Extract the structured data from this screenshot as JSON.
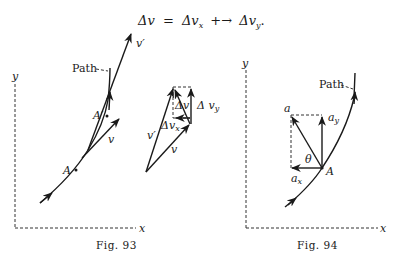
{
  "equation": {
    "lhs": "Δv",
    "eq": "=",
    "term1": "Δv",
    "term1_sub": "x",
    "op": "+→",
    "term2": "Δv",
    "term2_sub": "y",
    "end": "."
  },
  "fig93": {
    "caption": "Fig. 93",
    "axis_x": "x",
    "axis_y": "y",
    "path_label": "Path",
    "point_a": "A",
    "point_a_prime": "A′",
    "vec_v": "v",
    "vec_v_prime": "v′"
  },
  "vector_diagram": {
    "vec_v": "v",
    "vec_v_prime": "v′",
    "delta_v": "Δv",
    "delta_vx": "Δv",
    "delta_vx_sub": "x",
    "delta_vy": "Δ v",
    "delta_vy_sub": "y"
  },
  "fig94": {
    "caption": "Fig. 94",
    "axis_x": "x",
    "axis_y": "y",
    "path_label": "Path",
    "point_a": "A",
    "vec_a": "a",
    "vec_ax": "a",
    "vec_ax_sub": "x",
    "vec_ay": "a",
    "vec_ay_sub": "y",
    "angle": "θ"
  }
}
